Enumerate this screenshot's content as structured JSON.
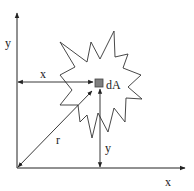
{
  "diagram": {
    "title": "",
    "colors": {
      "line": "#222222",
      "element_fill": "#7f7f7f",
      "element_stroke": "#444444",
      "background": "#ffffff"
    },
    "axes": {
      "x_label": "x",
      "y_label": "y"
    },
    "shape": {
      "name": "irregular area (star-shaped region)",
      "points": [
        [
          60,
          42
        ],
        [
          87,
          62
        ],
        [
          91,
          42
        ],
        [
          100,
          59
        ],
        [
          114,
          31
        ],
        [
          115,
          57
        ],
        [
          128,
          54
        ],
        [
          123,
          68
        ],
        [
          141,
          75
        ],
        [
          128,
          87
        ],
        [
          142,
          99
        ],
        [
          126,
          98
        ],
        [
          125,
          122
        ],
        [
          114,
          108
        ],
        [
          108,
          132
        ],
        [
          98,
          113
        ],
        [
          92,
          138
        ],
        [
          87,
          115
        ],
        [
          80,
          122
        ],
        [
          78,
          105
        ],
        [
          60,
          105
        ],
        [
          72,
          90
        ],
        [
          60,
          75
        ],
        [
          75,
          67
        ]
      ]
    },
    "element": {
      "label": "dA"
    },
    "dimensions": {
      "x_distance_label": "x",
      "y_distance_label": "y",
      "r_distance_label": "r"
    }
  }
}
